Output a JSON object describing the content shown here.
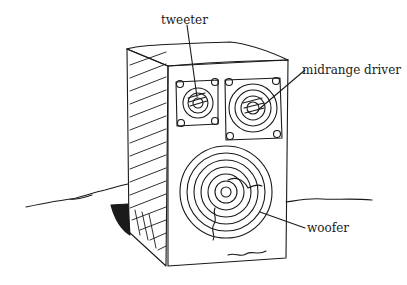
{
  "diagram": {
    "labels": {
      "tweeter": "tweeter",
      "midrange": "midrange driver",
      "woofer": "woofer"
    },
    "colors": {
      "ink": "#1a1a1a",
      "background": "#ffffff"
    }
  }
}
